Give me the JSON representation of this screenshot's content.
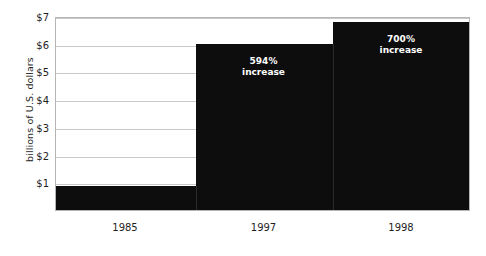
{
  "chart_data": {
    "type": "bar",
    "title": "",
    "xlabel": "",
    "ylabel": "billions of U.S. dollars",
    "categories": [
      "1985",
      "1997",
      "1998"
    ],
    "values": [
      0.85,
      6.0,
      6.8
    ],
    "ylim": [
      0,
      7
    ],
    "y_ticks": [
      {
        "value": 7,
        "label": "$7"
      },
      {
        "value": 6,
        "label": "$6"
      },
      {
        "value": 5,
        "label": "$5"
      },
      {
        "value": 4,
        "label": "$4"
      },
      {
        "value": 3,
        "label": "$3"
      },
      {
        "value": 2,
        "label": "$2"
      },
      {
        "value": 1,
        "label": "$1"
      }
    ],
    "grid": true,
    "legend": "none",
    "bar_color": "#0d0d0d",
    "grid_color": "#c9c9c9",
    "plot_border_color": "#b5b5b5",
    "annotation_color": "#ffffff",
    "annotations": [
      {
        "category": "1997",
        "line1": "594%",
        "line2": "increase"
      },
      {
        "category": "1998",
        "line1": "700%",
        "line2": "increase"
      }
    ]
  },
  "axis": {
    "y_title": "billions of U.S. dollars",
    "y_tick_labels": [
      "$7",
      "$6",
      "$5",
      "$4",
      "$3",
      "$2",
      "$1"
    ],
    "x_tick_labels": [
      "1985",
      "1997",
      "1998"
    ]
  },
  "annotations": {
    "bar1997": {
      "line1": "594%",
      "line2": "increase"
    },
    "bar1998": {
      "line1": "700%",
      "line2": "increase"
    }
  }
}
